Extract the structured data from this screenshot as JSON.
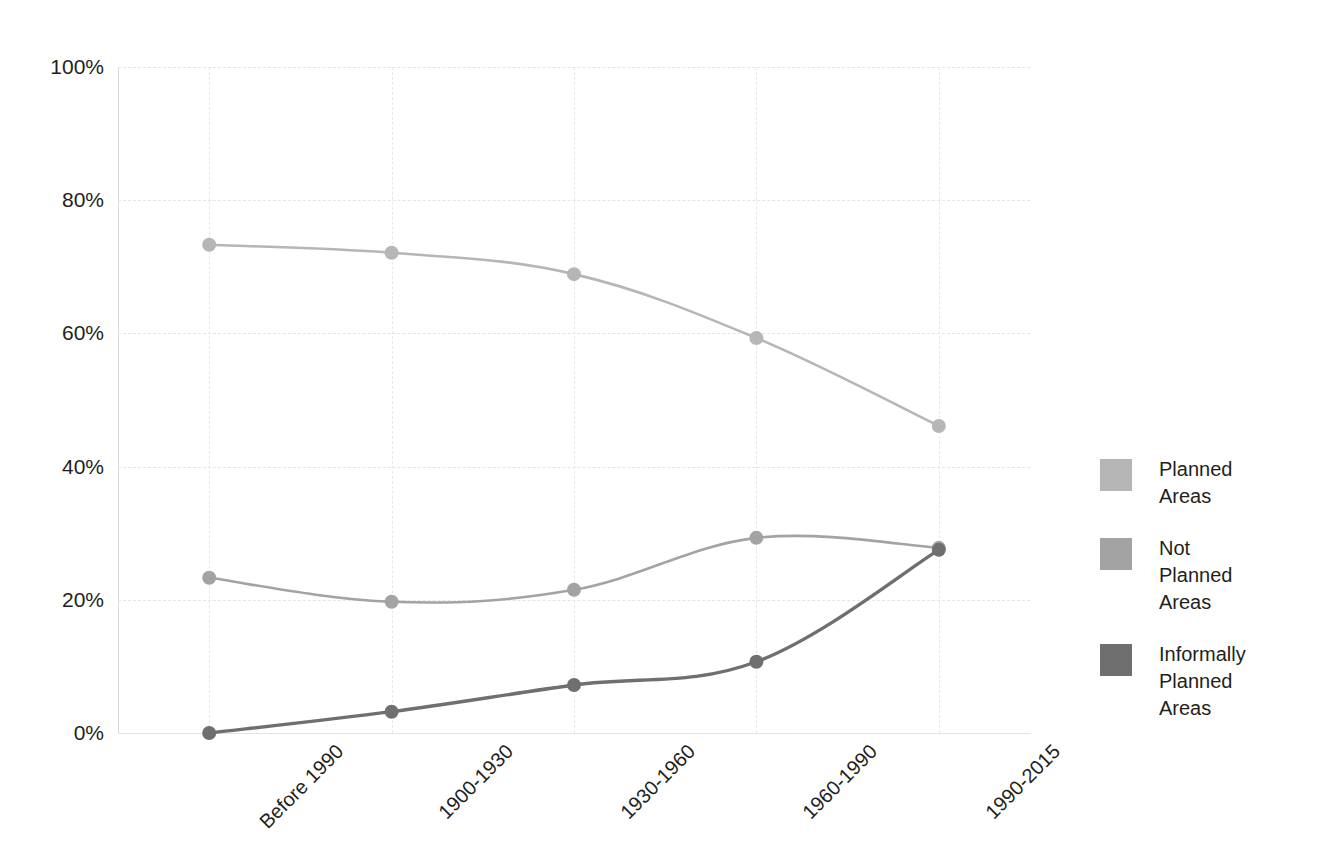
{
  "chart_data": {
    "type": "line",
    "title": "",
    "xlabel": "",
    "ylabel": "",
    "categories": [
      "Before 1990",
      "1900-1930",
      "1930-1960",
      "1960-1990",
      "1990-2015"
    ],
    "ylim": [
      0,
      100
    ],
    "yticks": [
      "0%",
      "20%",
      "40%",
      "60%",
      "80%",
      "100%"
    ],
    "ytick_values": [
      0,
      20,
      40,
      60,
      80,
      100
    ],
    "grid": true,
    "legend_position": "right",
    "series": [
      {
        "name": "Planned Areas",
        "label": "Planned\nAreas",
        "color": "#b6b6b6",
        "values": [
          73.3,
          72.1,
          68.9,
          59.3,
          46.1
        ]
      },
      {
        "name": "Not Planned Areas",
        "label": "Not\nPlanned\nAreas",
        "color": "#a3a3a3",
        "values": [
          23.3,
          19.7,
          21.5,
          29.3,
          27.8
        ]
      },
      {
        "name": "Informally Planned Areas",
        "label": "Informally\nPlanned\nAreas",
        "color": "#6f6f6f",
        "values": [
          0.0,
          3.2,
          7.2,
          10.7,
          27.5
        ]
      }
    ]
  },
  "axis": {
    "y_color": "#d9d9d9",
    "x_color": "#e2e2e2",
    "grid_color": "#e4e4e4"
  }
}
